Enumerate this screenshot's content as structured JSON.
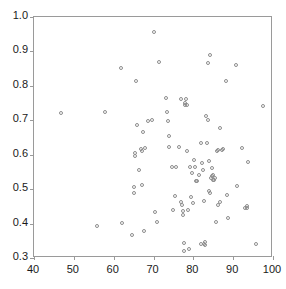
{
  "chart_data": {
    "type": "scatter",
    "title": "",
    "subtitle": "",
    "xlabel": "",
    "ylabel": "",
    "xlim": [
      40,
      100
    ],
    "ylim": [
      0.3,
      1.0
    ],
    "xticks": [
      40,
      50,
      60,
      70,
      80,
      90,
      100
    ],
    "yticks": [
      0.3,
      0.4,
      0.5,
      0.6,
      0.7,
      0.8,
      0.9,
      1.0
    ],
    "xtick_labels": [
      "40",
      "50",
      "60",
      "70",
      "80",
      "90",
      "100"
    ],
    "ytick_labels": [
      "0.3",
      "0.4",
      "0.5",
      "0.6",
      "0.7",
      "0.8",
      "0.9",
      "1.0"
    ],
    "grid": false,
    "legend": null,
    "marker": "open-circle",
    "marker_color": "#8d8d8d",
    "frame_color": "#9a9a9a",
    "background": "#ffffff",
    "n_points": 100,
    "points": [
      [
        46.9,
        0.72
      ],
      [
        55.8,
        0.392
      ],
      [
        57.7,
        0.723
      ],
      [
        61.9,
        0.851
      ],
      [
        62.0,
        0.402
      ],
      [
        64.6,
        0.367
      ],
      [
        65.0,
        0.489
      ],
      [
        65.1,
        0.506
      ],
      [
        65.3,
        0.604
      ],
      [
        65.4,
        0.597
      ],
      [
        65.6,
        0.815
      ],
      [
        65.9,
        0.685
      ],
      [
        66.4,
        0.556
      ],
      [
        66.8,
        0.618
      ],
      [
        67.0,
        0.611
      ],
      [
        67.2,
        0.513
      ],
      [
        67.4,
        0.665
      ],
      [
        67.6,
        0.377
      ],
      [
        67.8,
        0.62
      ],
      [
        68.5,
        0.699
      ],
      [
        70.1,
        0.955
      ],
      [
        70.3,
        0.434
      ],
      [
        70.9,
        0.404
      ],
      [
        71.5,
        0.87
      ],
      [
        73.2,
        0.765
      ],
      [
        73.4,
        0.723
      ],
      [
        73.6,
        0.698
      ],
      [
        73.8,
        0.654
      ],
      [
        74.0,
        0.623
      ],
      [
        74.6,
        0.564
      ],
      [
        75.0,
        0.439
      ],
      [
        75.3,
        0.481
      ],
      [
        76.4,
        0.623
      ],
      [
        76.8,
        0.762
      ],
      [
        77.0,
        0.464
      ],
      [
        77.2,
        0.455
      ],
      [
        77.3,
        0.424
      ],
      [
        77.4,
        0.437
      ],
      [
        77.6,
        0.344
      ],
      [
        77.7,
        0.319
      ],
      [
        78.0,
        0.751
      ],
      [
        78.1,
        0.762
      ],
      [
        78.3,
        0.744
      ],
      [
        78.4,
        0.611
      ],
      [
        78.6,
        0.44
      ],
      [
        78.9,
        0.325
      ],
      [
        79.4,
        0.477
      ],
      [
        79.6,
        0.547
      ],
      [
        79.8,
        0.459
      ],
      [
        80.1,
        0.585
      ],
      [
        80.4,
        0.563
      ],
      [
        80.7,
        0.523
      ],
      [
        81.3,
        0.54
      ],
      [
        81.8,
        0.34
      ],
      [
        82.0,
        0.633
      ],
      [
        82.2,
        0.575
      ],
      [
        82.4,
        0.556
      ],
      [
        82.6,
        0.467
      ],
      [
        82.9,
        0.346
      ],
      [
        83.0,
        0.337
      ],
      [
        83.3,
        0.712
      ],
      [
        83.4,
        0.634
      ],
      [
        83.6,
        0.7
      ],
      [
        83.7,
        0.866
      ],
      [
        83.9,
        0.581
      ],
      [
        84.0,
        0.496
      ],
      [
        84.1,
        0.489
      ],
      [
        84.2,
        0.89
      ],
      [
        84.4,
        0.532
      ],
      [
        84.6,
        0.56
      ],
      [
        84.8,
        0.537
      ],
      [
        85.0,
        0.541
      ],
      [
        85.2,
        0.527
      ],
      [
        85.4,
        0.531
      ],
      [
        85.6,
        0.404
      ],
      [
        86.0,
        0.61
      ],
      [
        86.3,
        0.455
      ],
      [
        86.6,
        0.463
      ],
      [
        86.8,
        0.679
      ],
      [
        87.2,
        0.614
      ],
      [
        87.4,
        0.617
      ],
      [
        88.2,
        0.815
      ],
      [
        88.4,
        0.484
      ],
      [
        88.8,
        0.417
      ],
      [
        90.6,
        0.862
      ],
      [
        91.0,
        0.51
      ],
      [
        92.3,
        0.619
      ],
      [
        93.0,
        0.446
      ],
      [
        93.4,
        0.45
      ],
      [
        93.5,
        0.444
      ],
      [
        93.8,
        0.578
      ],
      [
        95.8,
        0.34
      ],
      [
        97.6,
        0.741
      ],
      [
        69.5,
        0.7
      ],
      [
        75.6,
        0.565
      ],
      [
        79.1,
        0.563
      ],
      [
        80.9,
        0.525
      ],
      [
        84.9,
        0.527
      ],
      [
        86.1,
        0.613
      ],
      [
        77.9,
        0.744
      ],
      [
        82.7,
        0.34
      ]
    ]
  }
}
